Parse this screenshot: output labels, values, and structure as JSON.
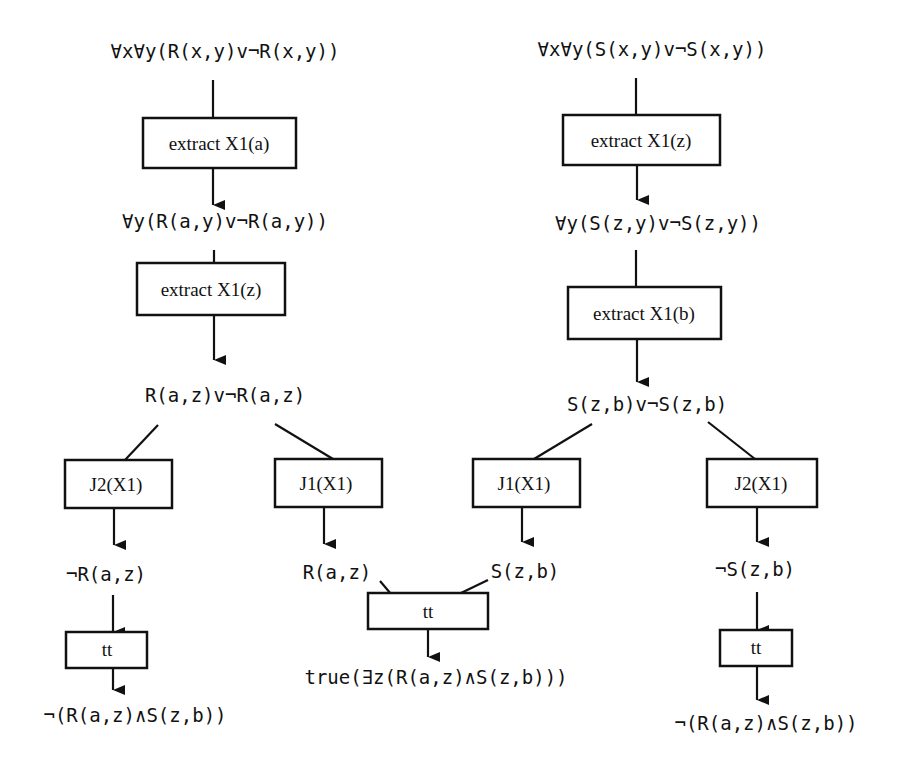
{
  "diagram": {
    "left_tree": {
      "root_formula": "∀x∀y(R(x,y)v¬R(x,y))",
      "step1_box": "extract X1(a)",
      "formula2": "∀y(R(a,y)v¬R(a,y))",
      "step2_box": "extract X1(z)",
      "formula3": "R(a,z)v¬R(a,z)",
      "branch_left_box": "J2(X1)",
      "branch_left_result": "¬R(a,z)",
      "branch_left_tt_box": "tt",
      "branch_left_conclusion": "¬(R(a,z)∧S(z,b))",
      "branch_right_box": "J1(X1)",
      "branch_right_result": "R(a,z)"
    },
    "right_tree": {
      "root_formula": "∀x∀y(S(x,y)v¬S(x,y))",
      "step1_box": "extract X1(z)",
      "formula2": "∀y(S(z,y)v¬S(z,y))",
      "step2_box": "extract X1(b)",
      "formula3": "S(z,b)v¬S(z,b)",
      "branch_left_box": "J1(X1)",
      "branch_left_result": "S(z,b)",
      "branch_right_box": "J2(X1)",
      "branch_right_result": "¬S(z,b)",
      "branch_right_tt_box": "tt",
      "branch_right_conclusion": "¬(R(a,z)∧S(z,b))"
    },
    "join": {
      "tt_box": "tt",
      "conclusion": "true(∃z(R(a,z)∧S(z,b)))"
    }
  }
}
